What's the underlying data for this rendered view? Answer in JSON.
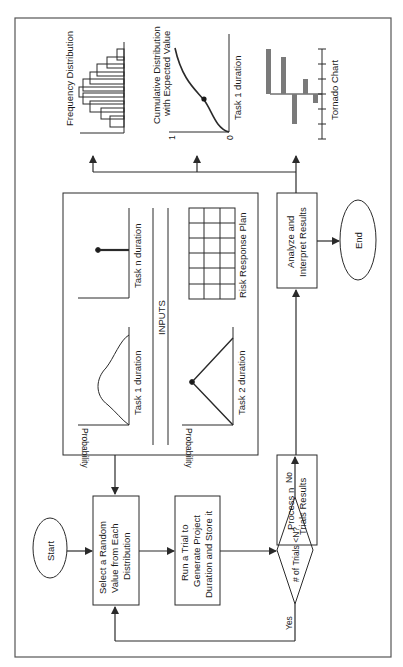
{
  "diagram": {
    "orientation": "rotated-90-ccw",
    "nodes": {
      "start": "Start",
      "select": [
        "Select a Random",
        "Value from Each",
        "Distribution"
      ],
      "run": [
        "Run a Trial to",
        "Generate Project",
        "Duration and Store it"
      ],
      "decision": "# of Trials <N?",
      "process": [
        "Process n",
        "Trials Results"
      ],
      "analyze": [
        "Analyze and",
        "Interpret Results"
      ],
      "end": "End"
    },
    "edge_labels": {
      "yes": "Yes",
      "no": "No"
    },
    "inputs": {
      "title": "INPUTS",
      "task1": "Task 1 duration",
      "task2": "Task 2 duration",
      "taskn": "Task n duration",
      "risk_plan": "Risk Response Plan",
      "y_axis": "Probability"
    },
    "outputs": {
      "frequency": "Frequency Distribution",
      "cumulative": [
        "Cumulative Distribution",
        "with Expected Value"
      ],
      "cumulative_x": "Task 1 duration",
      "cumulative_y_min": "0",
      "cumulative_y_max": "1",
      "tornado": "Tornado Chart"
    },
    "colors": {
      "line": "#2a2a2a",
      "tornado_bar": "#7a7a7a",
      "background": "#ffffff"
    }
  }
}
